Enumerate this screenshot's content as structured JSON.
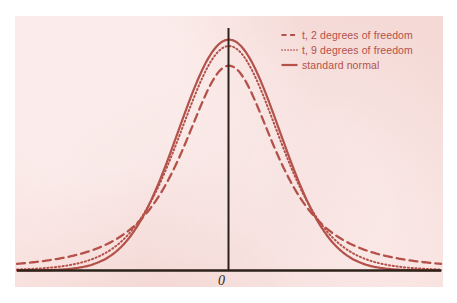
{
  "figure": {
    "width": 457,
    "height": 303,
    "panel_background": "#f8e0dd",
    "page_background": "#ffffff",
    "curve_color": "#b4514a",
    "axis_color": "#2b2219",
    "label_color": "#33281f"
  },
  "axes": {
    "x_axis_label": "",
    "y_axis_label": "",
    "origin_label": "0",
    "origin_label_name": "origin-tick-label"
  },
  "legend": {
    "position": "top-right",
    "entries": [
      {
        "label": "t, 2 degrees of freedom",
        "style": "dashed",
        "color": "#b4514a",
        "swatch_name": "legend-swatch-dashed"
      },
      {
        "label": "t, 9 degrees of freedom",
        "style": "dotted",
        "color": "#b4514a",
        "swatch_name": "legend-swatch-dotted"
      },
      {
        "label": "standard normal",
        "style": "solid",
        "color": "#b4514a",
        "swatch_name": "legend-swatch-solid"
      }
    ]
  },
  "chart_data": {
    "type": "line",
    "title": "",
    "subtitle": "",
    "xlabel": "",
    "ylabel": "",
    "xlim": [
      -4.2,
      4.2
    ],
    "ylim": [
      0,
      0.42
    ],
    "grid": false,
    "legend_position": "top-right",
    "x_ticks": [
      0
    ],
    "x_tick_labels": [
      "0"
    ],
    "y_ticks": [],
    "y_tick_labels": [],
    "annotations": [
      {
        "text": "0",
        "x": 0,
        "y": 0,
        "description": "origin label beneath the vertical axis"
      }
    ],
    "x": [
      -4.2,
      -4.0,
      -3.8,
      -3.6,
      -3.4,
      -3.2,
      -3.0,
      -2.8,
      -2.6,
      -2.4,
      -2.2,
      -2.0,
      -1.8,
      -1.6,
      -1.4,
      -1.2,
      -1.0,
      -0.8,
      -0.6,
      -0.4,
      -0.2,
      0.0,
      0.2,
      0.4,
      0.6,
      0.8,
      1.0,
      1.2,
      1.4,
      1.6,
      1.8,
      2.0,
      2.2,
      2.4,
      2.6,
      2.8,
      3.0,
      3.2,
      3.4,
      3.6,
      3.8,
      4.0,
      4.2
    ],
    "series": [
      {
        "name": "t, 2 degrees of freedom",
        "style": "dashed",
        "color": "#b4514a",
        "peak_value": 0.354,
        "values": [
          0.0093,
          0.0107,
          0.0124,
          0.0144,
          0.0168,
          0.0198,
          0.0234,
          0.0278,
          0.0334,
          0.0405,
          0.0496,
          0.0614,
          0.0767,
          0.0966,
          0.1222,
          0.1545,
          0.1925,
          0.2326,
          0.2689,
          0.2963,
          0.3127,
          0.3536,
          0.3127,
          0.2963,
          0.2689,
          0.2326,
          0.1925,
          0.1545,
          0.1222,
          0.0966,
          0.0767,
          0.0614,
          0.0496,
          0.0405,
          0.0334,
          0.0278,
          0.0234,
          0.0198,
          0.0168,
          0.0144,
          0.0124,
          0.0107,
          0.0093
        ]
      },
      {
        "name": "t, 9 degrees of freedom",
        "style": "dotted",
        "color": "#b4514a",
        "peak_value": 0.388,
        "values": [
          0.0019,
          0.0025,
          0.0032,
          0.0042,
          0.0055,
          0.0073,
          0.0097,
          0.013,
          0.0176,
          0.024,
          0.0331,
          0.0461,
          0.0646,
          0.0907,
          0.1267,
          0.1747,
          0.2353,
          0.3056,
          0.316,
          0.3574,
          0.3836,
          0.388,
          0.3836,
          0.3574,
          0.316,
          0.3056,
          0.2353,
          0.1747,
          0.1267,
          0.0907,
          0.0646,
          0.0461,
          0.0331,
          0.024,
          0.0176,
          0.013,
          0.0097,
          0.0073,
          0.0055,
          0.0042,
          0.0032,
          0.0025,
          0.0019
        ]
      },
      {
        "name": "standard normal",
        "style": "solid",
        "color": "#b4514a",
        "peak_value": 0.399,
        "values": [
          0.0001,
          0.0001,
          0.0003,
          0.0006,
          0.0012,
          0.0024,
          0.0044,
          0.0079,
          0.0136,
          0.0224,
          0.0355,
          0.054,
          0.079,
          0.1109,
          0.1497,
          0.1942,
          0.242,
          0.2897,
          0.3332,
          0.3683,
          0.391,
          0.3989,
          0.391,
          0.3683,
          0.3332,
          0.2897,
          0.242,
          0.1942,
          0.1497,
          0.1109,
          0.079,
          0.054,
          0.0355,
          0.0224,
          0.0136,
          0.0079,
          0.0044,
          0.0024,
          0.0012,
          0.0006,
          0.0003,
          0.0001,
          0.0001
        ]
      }
    ]
  }
}
